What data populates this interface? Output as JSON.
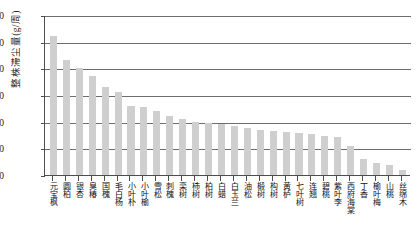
{
  "chart_data": {
    "type": "bar",
    "title": "",
    "xlabel": "",
    "ylabel": "整株滞尘量(g/周)",
    "ylim": [
      0,
      300
    ],
    "ytick_labels": [
      "300",
      "250",
      "200",
      "150",
      "100",
      "50",
      "0"
    ],
    "ytick_values": [
      300,
      250,
      200,
      150,
      100,
      50,
      0
    ],
    "grid": true,
    "legend": "none",
    "bar_color": "#cfcfcf",
    "axis_color": "#4d4d4d",
    "categories": [
      "元宝枫",
      "圆柏",
      "银杏",
      "臭椿",
      "国槐",
      "毛白杨",
      "小叶朴",
      "小叶榆",
      "雪松",
      "刺槐",
      "栾树",
      "柿树",
      "柏树",
      "白蜡",
      "白玉兰",
      "油松",
      "椴树",
      "构树",
      "黄栌",
      "七叶树",
      "连翘",
      "碧桃",
      "紫叶李",
      "西府海棠",
      "丁香",
      "榆叶梅",
      "山桃",
      "丝绵木"
    ],
    "values": [
      260,
      215,
      200,
      185,
      165,
      155,
      130,
      128,
      120,
      110,
      105,
      100,
      98,
      95,
      92,
      88,
      85,
      82,
      80,
      78,
      76,
      74,
      72,
      55,
      30,
      22,
      18,
      10
    ]
  }
}
